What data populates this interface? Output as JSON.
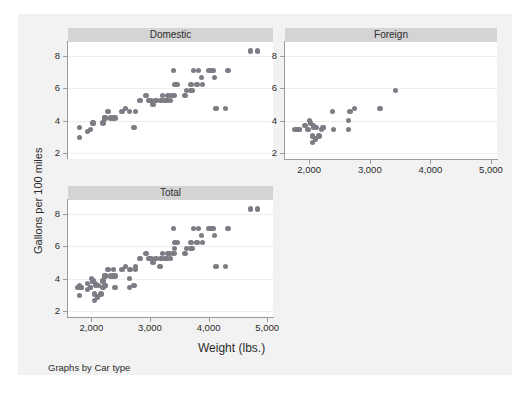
{
  "figure": {
    "background": "#f2f2f2",
    "panel_title_bg": "#d4d4d4",
    "marker_color": "#7c7c85",
    "note": "Graphs by Car type",
    "ylabel": "Gallons per 100 miles",
    "xlabel": "Weight (lbs.)"
  },
  "chart_data": {
    "type": "scatter",
    "title": "",
    "xlabel": "Weight (lbs.)",
    "ylabel": "Gallons per 100 miles",
    "note": "Graphs by Car type",
    "xlim": [
      1600,
      5100
    ],
    "ylim": [
      1.6,
      8.9
    ],
    "xticks": [
      2000,
      3000,
      4000,
      5000
    ],
    "xticklabels": [
      "2,000",
      "3,000",
      "4,000",
      "5,000"
    ],
    "yticks": [
      2,
      4,
      6,
      8
    ],
    "yticklabels": [
      "2",
      "4",
      "6",
      "8"
    ],
    "grid": "horizontal",
    "legend": "none",
    "layout": "by-group panels: Domestic, Foreign, Total",
    "panels": [
      {
        "label": "Domestic",
        "points": [
          [
            1800,
            3.57
          ],
          [
            1800,
            2.94
          ],
          [
            1930,
            3.33
          ],
          [
            1980,
            3.45
          ],
          [
            2020,
            3.85
          ],
          [
            2040,
            3.85
          ],
          [
            2200,
            3.85
          ],
          [
            2230,
            4.17
          ],
          [
            2230,
            4.17
          ],
          [
            2280,
            4.55
          ],
          [
            2330,
            4.17
          ],
          [
            2370,
            4.17
          ],
          [
            2400,
            4.17
          ],
          [
            2520,
            4.55
          ],
          [
            2580,
            4.76
          ],
          [
            2650,
            4.55
          ],
          [
            2730,
            3.57
          ],
          [
            2750,
            4.55
          ],
          [
            2830,
            5.26
          ],
          [
            2930,
            5.56
          ],
          [
            2980,
            5.26
          ],
          [
            3000,
            5.26
          ],
          [
            3020,
            5.26
          ],
          [
            3050,
            5.0
          ],
          [
            3100,
            5.26
          ],
          [
            3180,
            5.26
          ],
          [
            3200,
            5.26
          ],
          [
            3210,
            5.56
          ],
          [
            3250,
            5.26
          ],
          [
            3280,
            5.26
          ],
          [
            3300,
            5.26
          ],
          [
            3310,
            5.56
          ],
          [
            3330,
            5.56
          ],
          [
            3350,
            5.26
          ],
          [
            3380,
            5.56
          ],
          [
            3400,
            7.14
          ],
          [
            3420,
            5.56
          ],
          [
            3430,
            6.25
          ],
          [
            3470,
            6.25
          ],
          [
            3600,
            5.56
          ],
          [
            3620,
            5.88
          ],
          [
            3690,
            5.88
          ],
          [
            3700,
            6.25
          ],
          [
            3720,
            5.88
          ],
          [
            3740,
            7.14
          ],
          [
            3800,
            6.25
          ],
          [
            3830,
            7.14
          ],
          [
            3880,
            6.67
          ],
          [
            3900,
            6.25
          ],
          [
            4010,
            7.14
          ],
          [
            4060,
            7.14
          ],
          [
            4080,
            7.14
          ],
          [
            4100,
            6.67
          ],
          [
            4130,
            4.76
          ],
          [
            4290,
            4.76
          ],
          [
            4330,
            7.14
          ],
          [
            4720,
            8.33
          ],
          [
            4840,
            8.33
          ]
        ]
      },
      {
        "label": "Foreign",
        "points": [
          [
            1760,
            3.45
          ],
          [
            1800,
            3.45
          ],
          [
            1830,
            3.45
          ],
          [
            1830,
            3.45
          ],
          [
            1930,
            3.7
          ],
          [
            1980,
            3.45
          ],
          [
            2000,
            4.0
          ],
          [
            2020,
            3.85
          ],
          [
            2050,
            3.03
          ],
          [
            2050,
            2.63
          ],
          [
            2070,
            3.7
          ],
          [
            2070,
            3.57
          ],
          [
            2100,
            2.86
          ],
          [
            2120,
            3.57
          ],
          [
            2160,
            3.03
          ],
          [
            2200,
            3.45
          ],
          [
            2230,
            3.57
          ],
          [
            2240,
            3.57
          ],
          [
            2380,
            4.55
          ],
          [
            2400,
            3.45
          ],
          [
            2650,
            3.45
          ],
          [
            2650,
            4.0
          ],
          [
            2670,
            4.55
          ],
          [
            2750,
            4.76
          ],
          [
            3170,
            4.76
          ],
          [
            3420,
            5.88
          ]
        ]
      },
      {
        "label": "Total",
        "points": [
          [
            1760,
            3.45
          ],
          [
            1800,
            3.57
          ],
          [
            1800,
            2.94
          ],
          [
            1800,
            3.45
          ],
          [
            1830,
            3.45
          ],
          [
            1830,
            3.45
          ],
          [
            1930,
            3.33
          ],
          [
            1930,
            3.7
          ],
          [
            1980,
            3.45
          ],
          [
            1980,
            3.45
          ],
          [
            2000,
            4.0
          ],
          [
            2020,
            3.85
          ],
          [
            2020,
            3.85
          ],
          [
            2040,
            3.85
          ],
          [
            2050,
            3.03
          ],
          [
            2050,
            2.63
          ],
          [
            2070,
            3.7
          ],
          [
            2070,
            3.57
          ],
          [
            2100,
            2.86
          ],
          [
            2120,
            3.57
          ],
          [
            2160,
            3.03
          ],
          [
            2200,
            3.85
          ],
          [
            2200,
            3.45
          ],
          [
            2230,
            4.17
          ],
          [
            2230,
            4.17
          ],
          [
            2230,
            3.57
          ],
          [
            2240,
            3.57
          ],
          [
            2280,
            4.55
          ],
          [
            2330,
            4.17
          ],
          [
            2370,
            4.17
          ],
          [
            2380,
            4.55
          ],
          [
            2400,
            4.17
          ],
          [
            2400,
            3.45
          ],
          [
            2520,
            4.55
          ],
          [
            2580,
            4.76
          ],
          [
            2650,
            4.55
          ],
          [
            2650,
            3.45
          ],
          [
            2650,
            4.0
          ],
          [
            2670,
            4.55
          ],
          [
            2730,
            3.57
          ],
          [
            2750,
            4.55
          ],
          [
            2750,
            4.76
          ],
          [
            2830,
            5.26
          ],
          [
            2930,
            5.56
          ],
          [
            2980,
            5.26
          ],
          [
            3000,
            5.26
          ],
          [
            3020,
            5.26
          ],
          [
            3050,
            5.0
          ],
          [
            3100,
            5.26
          ],
          [
            3170,
            4.76
          ],
          [
            3180,
            5.26
          ],
          [
            3200,
            5.26
          ],
          [
            3210,
            5.56
          ],
          [
            3250,
            5.26
          ],
          [
            3280,
            5.26
          ],
          [
            3300,
            5.26
          ],
          [
            3310,
            5.56
          ],
          [
            3330,
            5.56
          ],
          [
            3350,
            5.26
          ],
          [
            3380,
            5.56
          ],
          [
            3400,
            7.14
          ],
          [
            3420,
            5.56
          ],
          [
            3420,
            5.88
          ],
          [
            3430,
            6.25
          ],
          [
            3470,
            6.25
          ],
          [
            3600,
            5.56
          ],
          [
            3620,
            5.88
          ],
          [
            3690,
            5.88
          ],
          [
            3700,
            6.25
          ],
          [
            3720,
            5.88
          ],
          [
            3740,
            7.14
          ],
          [
            3800,
            6.25
          ],
          [
            3830,
            7.14
          ],
          [
            3880,
            6.67
          ],
          [
            3900,
            6.25
          ],
          [
            4010,
            7.14
          ],
          [
            4060,
            7.14
          ],
          [
            4080,
            7.14
          ],
          [
            4100,
            6.67
          ],
          [
            4130,
            4.76
          ],
          [
            4290,
            4.76
          ],
          [
            4330,
            7.14
          ],
          [
            4720,
            8.33
          ],
          [
            4840,
            8.33
          ]
        ]
      }
    ]
  }
}
